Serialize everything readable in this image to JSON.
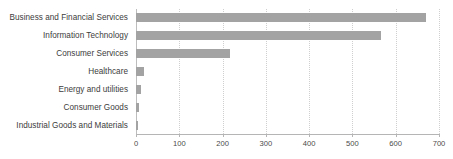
{
  "chart_data": {
    "type": "bar",
    "orientation": "horizontal",
    "title": "",
    "xlabel": "",
    "ylabel": "",
    "categories": [
      "Business and Financial Services",
      "Information Technology",
      "Consumer Services",
      "Healthcare",
      "Energy and utilities",
      "Consumer Goods",
      "Industrial Goods and Materials"
    ],
    "values": [
      670,
      566,
      217,
      18,
      12,
      6,
      5
    ],
    "xlim": [
      0,
      700
    ],
    "xticks": [
      0,
      100,
      200,
      300,
      400,
      500,
      600,
      700
    ],
    "xtick_labels": [
      "0",
      "100",
      "200",
      "300",
      "400",
      "500",
      "600",
      "700"
    ],
    "grid": true,
    "grid_axis": "x",
    "legend": false,
    "bar_color": "#a3a3a3",
    "gridline_color": "#cfcfcf",
    "axis_color": "#b5b5b5",
    "label_color": "#3c3c3c"
  }
}
